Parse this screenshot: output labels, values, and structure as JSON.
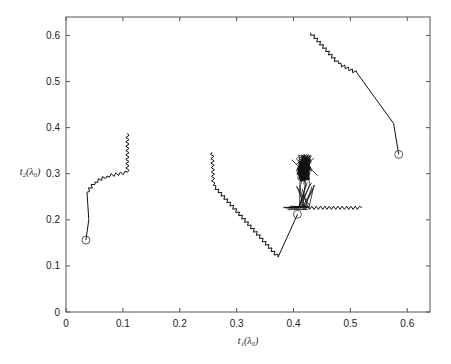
{
  "chart_data": {
    "type": "line",
    "title": "",
    "xlabel": "t₁(λ₀)",
    "ylabel": "t₂(λ₀)",
    "xlim": [
      0,
      0.64
    ],
    "ylim": [
      0,
      0.64
    ],
    "xticks": [
      0,
      0.1,
      0.2,
      0.3,
      0.4,
      0.5,
      0.6
    ],
    "yticks": [
      0,
      0.1,
      0.2,
      0.3,
      0.4,
      0.5,
      0.6
    ],
    "xtick_labels": [
      "0",
      "0.1",
      "0.2",
      "0.3",
      "0.4",
      "0.5",
      "0.6"
    ],
    "ytick_labels": [
      "0",
      "0.1",
      "0.2",
      "0.3",
      "0.4",
      "0.5",
      "0.6"
    ],
    "grid": false,
    "legend": null,
    "line_color": "#111111",
    "series": [
      {
        "name": "trajectory-1",
        "start_marker": "circle",
        "points": [
          [
            0.035,
            0.156
          ],
          [
            0.04,
            0.2
          ],
          [
            0.037,
            0.26
          ],
          [
            0.051,
            0.282
          ],
          [
            0.072,
            0.295
          ],
          [
            0.108,
            0.303
          ],
          [
            0.108,
            0.388
          ]
        ],
        "zigzag_segments": [
          [
            2,
            3
          ],
          [
            3,
            4
          ],
          [
            4,
            5
          ],
          [
            5,
            6
          ]
        ]
      },
      {
        "name": "trajectory-2",
        "start_marker": "circle",
        "points": [
          [
            0.407,
            0.212
          ],
          [
            0.373,
            0.119
          ],
          [
            0.259,
            0.275
          ],
          [
            0.257,
            0.347
          ]
        ],
        "zigzag_segments": [
          [
            1,
            2
          ],
          [
            2,
            3
          ]
        ]
      },
      {
        "name": "trajectory-3-oscillating",
        "start_marker": "none",
        "points": [
          [
            0.417,
            0.226
          ],
          [
            0.52,
            0.226
          ]
        ],
        "burst_center": [
          0.418,
          0.3
        ],
        "burst_top": [
          0.421,
          0.343
        ],
        "burst_base_x": [
          0.382,
          0.43
        ],
        "burst_base_y": 0.226,
        "zigzag_segments": [
          [
            0,
            1
          ]
        ]
      },
      {
        "name": "trajectory-4",
        "start_marker": "circle",
        "points": [
          [
            0.585,
            0.342
          ],
          [
            0.576,
            0.409
          ],
          [
            0.512,
            0.518
          ],
          [
            0.479,
            0.539
          ],
          [
            0.43,
            0.606
          ]
        ],
        "zigzag_segments": [
          [
            2,
            3
          ],
          [
            3,
            4
          ]
        ]
      }
    ]
  }
}
